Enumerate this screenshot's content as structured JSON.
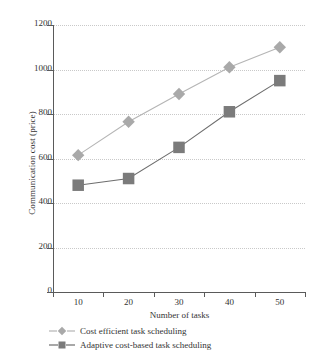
{
  "chart_data": {
    "type": "line",
    "title": "",
    "xlabel": "Number of tasks",
    "ylabel": "Communication cost (price)",
    "categories": [
      10,
      20,
      30,
      40,
      50
    ],
    "x_tick_labels": [
      "10",
      "20",
      "30",
      "40",
      "50"
    ],
    "y_tick_labels": [
      "0",
      "200",
      "400",
      "600",
      "800",
      "1000",
      "1200"
    ],
    "y_ticks": [
      0,
      200,
      400,
      600,
      800,
      1000,
      1200
    ],
    "ylim": [
      0,
      1200
    ],
    "grid": "horizontal-dotted",
    "legend_position": "below-axis-left",
    "series": [
      {
        "name": "Cost efficient task scheduling",
        "marker": "diamond",
        "color": "#a9a9a9",
        "line_color": "#b5b5b5",
        "values": [
          615,
          765,
          890,
          1010,
          1100
        ]
      },
      {
        "name": "Adaptive cost-based task scheduling",
        "marker": "square",
        "color": "#7b7b7b",
        "line_color": "#6e6e6e",
        "values": [
          480,
          510,
          650,
          810,
          950
        ]
      }
    ]
  },
  "legend": {
    "items": [
      {
        "label": "Cost efficient task scheduling"
      },
      {
        "label": "Adaptive cost-based task scheduling"
      }
    ]
  },
  "colors": {
    "axis": "#5a5a5a",
    "grid": "#c9c9c9",
    "text": "#333333",
    "background": "#ffffff",
    "series_1": "#a9a9a9",
    "series_2": "#7b7b7b"
  }
}
